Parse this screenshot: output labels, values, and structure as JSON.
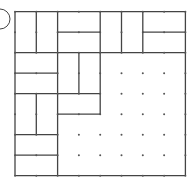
{
  "figure": {
    "label_circle": {
      "cx": 0,
      "cy": 19,
      "r": 10
    },
    "grid": {
      "cols": 8,
      "rows": 8,
      "x0": 15,
      "y0": 11.7,
      "cw": 21.3,
      "ch": 20.5
    },
    "colors": {
      "line": "#444444",
      "dot": "#555555",
      "background": "#ffffff"
    },
    "h_segments": [
      [
        0,
        0,
        8
      ],
      [
        8,
        0,
        8
      ],
      [
        2,
        0,
        8
      ],
      [
        1,
        2,
        4
      ],
      [
        1,
        6,
        8
      ],
      [
        3,
        0,
        2
      ],
      [
        4,
        0,
        4
      ],
      [
        5,
        2,
        4
      ],
      [
        6,
        0,
        2
      ],
      [
        7,
        0,
        2
      ]
    ],
    "v_segments": [
      [
        0,
        0,
        8
      ],
      [
        8,
        0,
        8
      ],
      [
        1,
        0,
        2
      ],
      [
        1,
        4,
        6
      ],
      [
        2,
        0,
        8
      ],
      [
        3,
        2,
        4
      ],
      [
        4,
        0,
        2
      ],
      [
        4,
        2,
        5
      ],
      [
        5,
        0,
        2
      ],
      [
        6,
        0,
        2
      ]
    ]
  }
}
